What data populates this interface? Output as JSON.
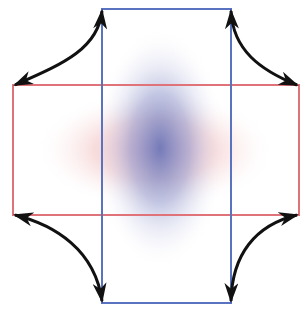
{
  "diagram": {
    "colors": {
      "blue_rect": "#5a73c0",
      "red_rect": "#e0737a",
      "blob_blue": "#7f86c0",
      "blob_red": "#f0a8a8",
      "arrow": "#111111",
      "background": "#ffffff"
    },
    "rectangles": [
      {
        "name": "vertical-rectangle",
        "color": "blue",
        "x": 102,
        "y": 9,
        "width": 129,
        "height": 294
      },
      {
        "name": "horizontal-rectangle",
        "color": "red",
        "x": 13,
        "y": 85,
        "width": 286,
        "height": 130
      }
    ],
    "arrows": [
      {
        "name": "top-left",
        "from": "blue top-left corner",
        "to": "red top-left corner",
        "double_headed": true
      },
      {
        "name": "top-right",
        "from": "blue top-right corner",
        "to": "red top-right corner",
        "double_headed": true
      },
      {
        "name": "bottom-left",
        "from": "red bottom-left corner",
        "to": "blue bottom-left corner",
        "double_headed": true
      },
      {
        "name": "bottom-right",
        "from": "red bottom-right corner",
        "to": "blue bottom-right corner",
        "double_headed": true
      }
    ]
  }
}
